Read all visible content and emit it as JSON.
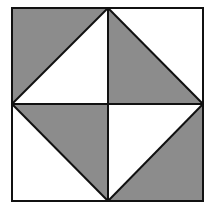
{
  "diagram": {
    "type": "geometric-tiling",
    "colors": {
      "shade": "#8c8c8c",
      "background": "#ffffff",
      "stroke": "#111111"
    },
    "square": {
      "x1": 12,
      "y1": 8,
      "x2": 203,
      "y2": 201
    },
    "center": {
      "x": 108,
      "y": 104
    },
    "quadrants": [
      {
        "position": "top-left",
        "shaded": "top-left triangle"
      },
      {
        "position": "top-right",
        "shaded": "bottom-left triangle"
      },
      {
        "position": "bottom-left",
        "shaded": "top-right triangle"
      },
      {
        "position": "bottom-right",
        "shaded": "bottom-right triangle"
      }
    ]
  }
}
